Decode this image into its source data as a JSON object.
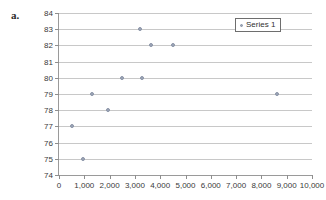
{
  "figure": {
    "label": "a."
  },
  "legend": {
    "position": "top-right",
    "entries": [
      {
        "label": "Series 1",
        "marker": "dot-marker",
        "color": "#9ea7b8"
      }
    ]
  },
  "chart_data": {
    "type": "scatter",
    "title": "",
    "xlabel": "",
    "ylabel": "",
    "xlim": [
      0,
      10000
    ],
    "ylim": [
      74,
      84
    ],
    "xticks": [
      0,
      1000,
      2000,
      3000,
      4000,
      5000,
      6000,
      7000,
      8000,
      9000,
      10000
    ],
    "xticklabels": [
      "0",
      "1,000",
      "2,000",
      "3,000",
      "4,000",
      "5,000",
      "6,000",
      "7,000",
      "8,000",
      "9,000",
      "10,000"
    ],
    "yticks": [
      74,
      75,
      76,
      77,
      78,
      79,
      80,
      81,
      82,
      83,
      84
    ],
    "yticklabels": [
      "74",
      "75",
      "76",
      "77",
      "78",
      "79",
      "80",
      "81",
      "82",
      "83",
      "84"
    ],
    "grid": "horizontal",
    "grid_color": "#c8c8c8",
    "series": [
      {
        "name": "Series 1",
        "color": "#9ea7b8",
        "marker": "circle",
        "points": [
          {
            "x": 500,
            "y": 77
          },
          {
            "x": 950,
            "y": 75
          },
          {
            "x": 1300,
            "y": 79
          },
          {
            "x": 1950,
            "y": 78
          },
          {
            "x": 2500,
            "y": 80
          },
          {
            "x": 3200,
            "y": 83
          },
          {
            "x": 3300,
            "y": 80
          },
          {
            "x": 3650,
            "y": 82
          },
          {
            "x": 4500,
            "y": 82
          },
          {
            "x": 8600,
            "y": 79
          }
        ]
      }
    ]
  }
}
